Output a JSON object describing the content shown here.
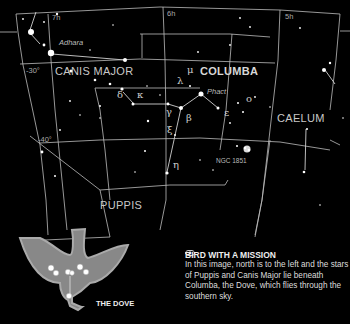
{
  "chart": {
    "ra_labels": {
      "h7": "7h",
      "h6": "6h",
      "h5": "5h"
    },
    "dec_labels": {
      "d30": "-30°",
      "d40": "-40°"
    },
    "constellations": {
      "canis_major": "CANIS MAJOR",
      "columba": "COLUMBA",
      "caelum": "CAELUM",
      "puppis": "PUPPIS"
    },
    "star_names": {
      "adhara": "Adhara",
      "phact": "Phact"
    },
    "greek_letters": {
      "mu": "μ",
      "lambda": "λ",
      "delta": "δ",
      "kappa": "κ",
      "gamma": "γ",
      "xi": "ξ",
      "beta": "β",
      "epsilon": "ε",
      "omicron": "ο",
      "eta": "η"
    },
    "deep_sky": {
      "ngc1851": "NGC 1851"
    },
    "line_color": "#c8c8c8",
    "background": "#000000"
  },
  "inset": {
    "label": "THE DOVE",
    "fill_color": "#8a8a8a"
  },
  "caption": {
    "title": "BIRD WITH A MISSION",
    "icon": "eye-icon",
    "body": "In this image, north is to the left and the stars of Puppis and Canis Major lie beneath Columba, the Dove, which flies through the southern sky."
  }
}
